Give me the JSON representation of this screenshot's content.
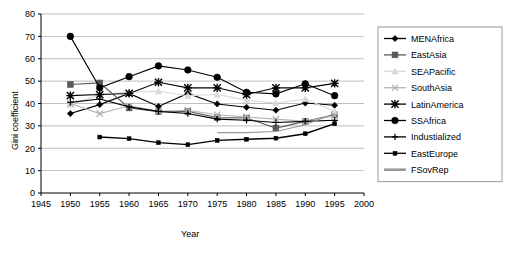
{
  "chart_data": {
    "type": "line",
    "title": "",
    "xlabel": "Year",
    "ylabel": "Gini coefficient",
    "xlim": [
      1945,
      2000
    ],
    "ylim": [
      0,
      80
    ],
    "xticks": [
      1945,
      1950,
      1955,
      1960,
      1965,
      1970,
      1975,
      1980,
      1985,
      1990,
      1995,
      2000
    ],
    "yticks": [
      0,
      10,
      20,
      30,
      40,
      50,
      60,
      70,
      80
    ],
    "grid": "horizontal",
    "legend_position": "right",
    "x": [
      1950,
      1955,
      1960,
      1965,
      1970,
      1975,
      1980,
      1985,
      1990,
      1995
    ],
    "series": [
      {
        "name": "MENAfrica",
        "marker": "diamond",
        "color": "#000000",
        "x": [
          1950,
          1955,
          1960,
          1965,
          1970,
          1975,
          1980,
          1985,
          1990,
          1995
        ],
        "values": [
          35.5,
          39.5,
          44.5,
          38.7,
          44.5,
          39.8,
          38.3,
          37.0,
          40.2,
          39.2
        ]
      },
      {
        "name": "EastAsia",
        "marker": "square",
        "color": "#595959",
        "x": [
          1950,
          1955,
          1960,
          1965,
          1970,
          1975,
          1980,
          1985,
          1990,
          1995
        ],
        "values": [
          48.5,
          49.2,
          38.0,
          36.3,
          36.5,
          33.7,
          33.5,
          29.0,
          32.0,
          35.0
        ]
      },
      {
        "name": "SEAPacific",
        "marker": "triangle",
        "color": "#d9d9d9",
        "x": [
          1950,
          1955,
          1960,
          1965,
          1970,
          1975,
          1980,
          1985,
          1990,
          1995
        ],
        "values": [
          39.5,
          44.0,
          45.0,
          45.5,
          43.5,
          44.0,
          41.5,
          40.2,
          42.0,
          36.5
        ]
      },
      {
        "name": "SouthAsia",
        "marker": "cross",
        "color": "#b3b3b3",
        "x": [
          1950,
          1955,
          1960,
          1965,
          1970,
          1975,
          1980,
          1985,
          1990,
          1995
        ],
        "values": [
          40.0,
          35.5,
          39.0,
          36.5,
          37.0,
          35.0,
          34.0,
          33.0,
          32.0,
          34.5
        ]
      },
      {
        "name": "LatinAmerica",
        "marker": "star",
        "color": "#000000",
        "x": [
          1950,
          1955,
          1960,
          1965,
          1970,
          1975,
          1980,
          1985,
          1990,
          1995
        ],
        "values": [
          43.5,
          44.0,
          44.5,
          49.5,
          47.0,
          47.0,
          44.0,
          47.0,
          47.0,
          49.0
        ]
      },
      {
        "name": "SSAfrica",
        "marker": "circle",
        "color": "#000000",
        "x": [
          1950,
          1955,
          1960,
          1965,
          1970,
          1975,
          1980,
          1985,
          1990,
          1995
        ],
        "values": [
          70.0,
          47.0,
          52.0,
          56.8,
          55.0,
          51.7,
          45.0,
          44.3,
          48.8,
          43.5
        ]
      },
      {
        "name": "Industialized",
        "marker": "plus",
        "color": "#000000",
        "x": [
          1950,
          1955,
          1960,
          1965,
          1970,
          1975,
          1980,
          1985,
          1990,
          1995
        ],
        "values": [
          40.5,
          42.0,
          38.5,
          36.5,
          35.5,
          33.0,
          32.5,
          31.5,
          32.0,
          32.5
        ]
      },
      {
        "name": "EastEurope",
        "marker": "smallsquare",
        "color": "#000000",
        "x": [
          1955,
          1960,
          1965,
          1970,
          1975,
          1980,
          1985,
          1990,
          1995
        ],
        "values": [
          25.0,
          24.3,
          22.5,
          21.6,
          23.5,
          24.0,
          24.5,
          26.5,
          31.0
        ]
      },
      {
        "name": "FSovRep",
        "marker": "dash",
        "color": "#999999",
        "x": [
          1975,
          1980,
          1985,
          1990,
          1995
        ],
        "values": [
          27.0,
          27.0,
          27.5,
          30.5,
          35.5
        ]
      }
    ]
  },
  "legend": {
    "items": [
      {
        "label": "MENAfrica"
      },
      {
        "label": "EastAsia"
      },
      {
        "label": "SEAPacific"
      },
      {
        "label": "SouthAsia"
      },
      {
        "label": "LatinAmerica"
      },
      {
        "label": "SSAfrica"
      },
      {
        "label": "Industialized"
      },
      {
        "label": "EastEurope"
      },
      {
        "label": "FSovRep"
      }
    ]
  },
  "colors": {
    "plot_background": "#ffffff",
    "gridline": "#808080",
    "axis": "#000000",
    "legend_border": "#9a9a9a"
  }
}
